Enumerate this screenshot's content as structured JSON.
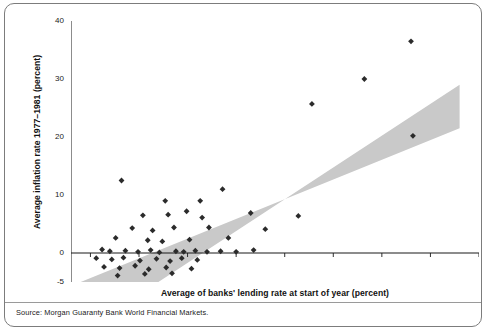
{
  "figure": {
    "source_note": "Source: Morgan Guaranty Bank World Financial Markets.",
    "frame_color": "#7c7c7c",
    "band_color": "#c9c9c9",
    "marker_color": "#2b2b2b",
    "axis_color": "#1a1a1a"
  },
  "chart_data": {
    "type": "scatter",
    "title": "",
    "xlabel": "Average of banks' lending rate at start of year (percent)",
    "ylabel": "Average inflation rate 1977–1981 (percent)",
    "xlim": [
      -2,
      40
    ],
    "ylim": [
      -5,
      40
    ],
    "grid": false,
    "legend": null,
    "y_ticks": [
      40,
      30,
      20,
      10,
      0,
      -5
    ],
    "y_tick_labels": [
      "40",
      "30",
      "20",
      "10",
      "0",
      "-5"
    ],
    "x_ticks": [
      0,
      5,
      10,
      15,
      20,
      25,
      30,
      35,
      40
    ],
    "x_tick_labels": [
      "",
      "",
      "",
      "",
      "",
      "",
      "",
      "",
      ""
    ],
    "zero_line_y": 0,
    "annotations": [
      {
        "name": "shaded-band",
        "description": "Grey diagonal band running from lower-left to upper-right indicating the broad positive relationship between lending rates and inflation.",
        "polygon": [
          [
            -1.0,
            -5.0
          ],
          [
            7.0,
            -5.0
          ],
          [
            38.0,
            29.0
          ],
          [
            38.0,
            21.5
          ]
        ]
      }
    ],
    "points": [
      {
        "x": 3.2,
        "y": 12.5
      },
      {
        "x": 7.7,
        "y": 9.0
      },
      {
        "x": 11.3,
        "y": 9.0
      },
      {
        "x": 13.6,
        "y": 11.0
      },
      {
        "x": 5.4,
        "y": 6.5
      },
      {
        "x": 8.0,
        "y": 6.6
      },
      {
        "x": 9.9,
        "y": 7.2
      },
      {
        "x": 11.5,
        "y": 6.1
      },
      {
        "x": 16.5,
        "y": 6.9
      },
      {
        "x": 21.4,
        "y": 6.4
      },
      {
        "x": 4.3,
        "y": 4.3
      },
      {
        "x": 6.4,
        "y": 3.9
      },
      {
        "x": 8.6,
        "y": 4.4
      },
      {
        "x": 12.2,
        "y": 4.4
      },
      {
        "x": 18.0,
        "y": 4.1
      },
      {
        "x": 2.6,
        "y": 2.6
      },
      {
        "x": 5.9,
        "y": 2.2
      },
      {
        "x": 7.4,
        "y": 2.0
      },
      {
        "x": 10.2,
        "y": 2.3
      },
      {
        "x": 14.2,
        "y": 2.6
      },
      {
        "x": 1.2,
        "y": 0.6
      },
      {
        "x": 2.0,
        "y": 0.3
      },
      {
        "x": 3.6,
        "y": 0.4
      },
      {
        "x": 4.9,
        "y": 0.2
      },
      {
        "x": 6.2,
        "y": 0.5
      },
      {
        "x": 7.1,
        "y": 0.1
      },
      {
        "x": 8.8,
        "y": 0.3
      },
      {
        "x": 9.6,
        "y": 0.2
      },
      {
        "x": 10.8,
        "y": 0.4
      },
      {
        "x": 12.0,
        "y": 0.2
      },
      {
        "x": 13.4,
        "y": 0.3
      },
      {
        "x": 15.0,
        "y": 0.2
      },
      {
        "x": 16.8,
        "y": 0.5
      },
      {
        "x": 0.6,
        "y": -0.9
      },
      {
        "x": 2.2,
        "y": -1.1
      },
      {
        "x": 3.4,
        "y": -0.8
      },
      {
        "x": 5.1,
        "y": -1.3
      },
      {
        "x": 6.8,
        "y": -1.0
      },
      {
        "x": 8.2,
        "y": -1.4
      },
      {
        "x": 9.4,
        "y": -0.9
      },
      {
        "x": 11.0,
        "y": -1.2
      },
      {
        "x": 1.4,
        "y": -2.4
      },
      {
        "x": 3.0,
        "y": -2.6
      },
      {
        "x": 4.6,
        "y": -2.2
      },
      {
        "x": 6.0,
        "y": -2.8
      },
      {
        "x": 7.8,
        "y": -2.5
      },
      {
        "x": 10.4,
        "y": -2.7
      },
      {
        "x": 2.8,
        "y": -3.9
      },
      {
        "x": 5.6,
        "y": -3.6
      },
      {
        "x": 8.4,
        "y": -3.5
      },
      {
        "x": 22.8,
        "y": 25.7
      },
      {
        "x": 28.2,
        "y": 30.0
      },
      {
        "x": 33.0,
        "y": 36.5
      },
      {
        "x": 33.2,
        "y": 20.2
      }
    ]
  }
}
